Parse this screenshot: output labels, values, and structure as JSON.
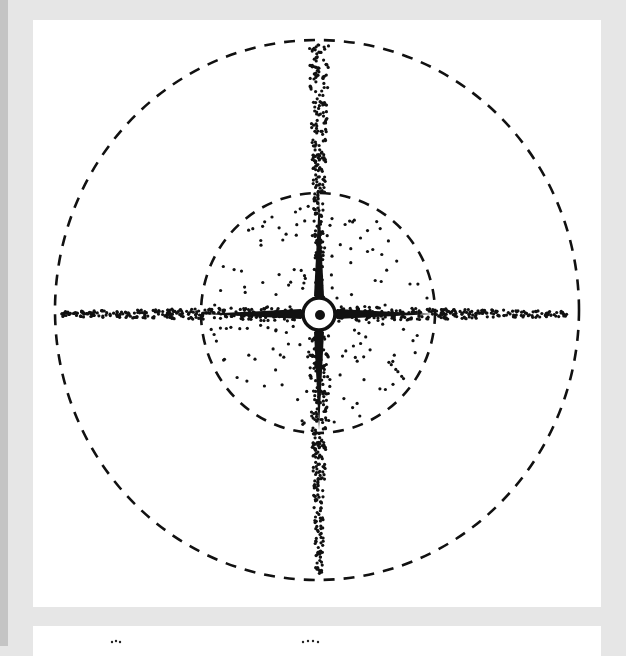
{
  "figure": {
    "colors": {
      "ink": "#111111",
      "background": "#ffffff",
      "border": "#e6e6e6"
    },
    "outer_circle": {
      "cx": 317,
      "cy": 310,
      "rx": 262,
      "ry": 270,
      "style": "dashed"
    },
    "inner_circle": {
      "cx": 318,
      "cy": 313,
      "rx": 117,
      "ry": 120,
      "style": "dashed"
    },
    "center": {
      "cx": 319,
      "cy": 314,
      "ring_r": 16,
      "dot_r": 5
    }
  },
  "next_panel": {
    "partial": true
  }
}
